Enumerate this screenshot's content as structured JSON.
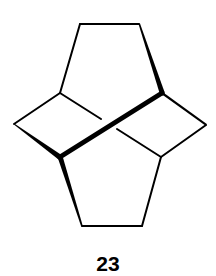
{
  "diagram": {
    "type": "chemical-structure",
    "compound_label": "23",
    "colors": {
      "background": "#ffffff",
      "bond": "#000000"
    },
    "atoms": {
      "top_left": [
        80,
        24
      ],
      "top_right": [
        139,
        24
      ],
      "upper_left_junction": [
        60,
        93
      ],
      "upper_right_junction": [
        162,
        93
      ],
      "left_vertex": [
        14,
        124
      ],
      "right_vertex": [
        206,
        125
      ],
      "lower_left_junction": [
        60,
        157
      ],
      "lower_right_junction": [
        161,
        157
      ],
      "bottom_left": [
        82,
        226
      ],
      "bottom_right": [
        142,
        226
      ]
    },
    "rings": [
      {
        "name": "top-pentagon",
        "atoms": [
          "upper_left_junction",
          "top_left",
          "top_right",
          "upper_right_junction",
          "lower_left_junction"
        ]
      },
      {
        "name": "left-cyclobutane",
        "atoms": [
          "upper_left_junction",
          "left_vertex",
          "lower_left_junction",
          "upper_right_junction"
        ]
      },
      {
        "name": "right-cyclobutane",
        "atoms": [
          "upper_right_junction",
          "right_vertex",
          "lower_right_junction",
          "upper_left_junction"
        ]
      },
      {
        "name": "bottom-pentagon",
        "atoms": [
          "lower_left_junction",
          "bottom_left",
          "bottom_right",
          "lower_right_junction"
        ]
      }
    ],
    "bonds": [
      {
        "from": "top_left",
        "to": "top_right",
        "style": "plain"
      },
      {
        "from": "top_left",
        "to": "upper_left_junction",
        "style": "plain"
      },
      {
        "from": "top_right",
        "to": "upper_right_junction",
        "style": "wedge"
      },
      {
        "from": "upper_left_junction",
        "to": "left_vertex",
        "style": "plain"
      },
      {
        "from": "left_vertex",
        "to": "lower_left_junction",
        "style": "wedge"
      },
      {
        "from": "upper_right_junction",
        "to": "right_vertex",
        "style": "wedge"
      },
      {
        "from": "right_vertex",
        "to": "lower_right_junction",
        "style": "plain"
      },
      {
        "from": "lower_left_junction",
        "to": "upper_right_junction",
        "style": "bold"
      },
      {
        "from": "upper_left_junction",
        "to": "lower_right_junction",
        "style": "plain-broken"
      },
      {
        "from": "lower_left_junction",
        "to": "bottom_left",
        "style": "wedge"
      },
      {
        "from": "bottom_left",
        "to": "bottom_right",
        "style": "plain"
      },
      {
        "from": "bottom_right",
        "to": "lower_right_junction",
        "style": "plain"
      }
    ]
  }
}
